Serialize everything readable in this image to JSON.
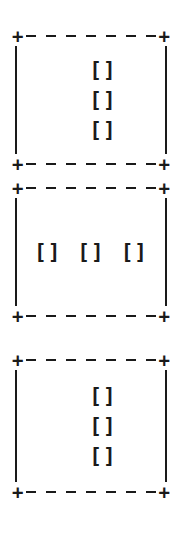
{
  "figure": {
    "type": "ascii-art-layout",
    "glyphs": {
      "corner": "+",
      "dash": "-",
      "vertical": "|",
      "slot": "[]"
    },
    "colors": {
      "ink": "#1a1a1a",
      "background": "#ffffff"
    },
    "dash_count_per_rule": 7,
    "boxes": [
      {
        "id": "box-1",
        "orientation": "vertical",
        "slot_count": 3,
        "slots": [
          "[]",
          "[]",
          "[]"
        ]
      },
      {
        "id": "box-2",
        "orientation": "horizontal",
        "slot_count": 3,
        "slots": [
          "[]",
          "[]",
          "[]"
        ]
      },
      {
        "id": "box-3",
        "orientation": "vertical",
        "slot_count": 3,
        "slots": [
          "[]",
          "[]",
          "[]"
        ]
      }
    ]
  }
}
